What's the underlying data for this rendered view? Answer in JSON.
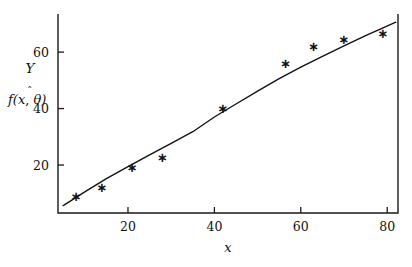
{
  "chart_data": {
    "type": "scatter",
    "title": "",
    "subtitle": "",
    "xlabel": "x",
    "ylabel": "Y",
    "ylabel_secondary": "f(x, θ̂)",
    "xlim": [
      3.8,
      82.5
    ],
    "ylim": [
      3.0,
      73.5
    ],
    "xticks": [
      20,
      40,
      60,
      80
    ],
    "xtick_labels": [
      "20",
      "40",
      "60",
      "80"
    ],
    "yticks": [
      20,
      40,
      60
    ],
    "ytick_labels": [
      "20",
      "40",
      "60"
    ],
    "grid": false,
    "legend": null,
    "marker": "asterisk",
    "marker_glyph": "∗",
    "series": [
      {
        "name": "observed",
        "type": "scatter",
        "x": [
          8.0,
          14.0,
          21.0,
          28.0,
          42.0,
          56.5,
          63.0,
          70.0,
          79.0
        ],
        "y": [
          9.0,
          12.0,
          19.0,
          22.5,
          40.0,
          56.0,
          62.0,
          64.5,
          66.5
        ]
      },
      {
        "name": "fitted",
        "type": "line",
        "x": [
          5.0,
          10.0,
          15.0,
          20.0,
          25.0,
          30.0,
          35.0,
          40.0,
          45.0,
          50.0,
          55.0,
          60.0,
          65.0,
          70.0,
          75.0,
          78.0,
          82.0
        ],
        "y": [
          5.6,
          10.5,
          15.2,
          19.4,
          23.6,
          27.7,
          31.8,
          37.0,
          41.6,
          46.2,
          50.6,
          54.7,
          58.5,
          62.2,
          65.8,
          67.9,
          70.6
        ]
      }
    ],
    "colors": {
      "axis": "#1a1a1a",
      "curve": "#111111",
      "marker": "#111111",
      "background": "#ffffff"
    }
  },
  "axis_titles": {
    "y_top": "Y",
    "y_bottom": "f(x, θ̂)",
    "x": "x"
  }
}
